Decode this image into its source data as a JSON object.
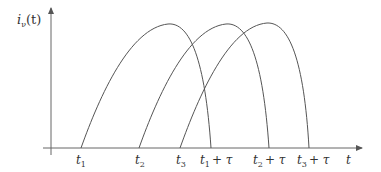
{
  "diagram": {
    "y_axis_label": {
      "base": "i",
      "sub": "ν",
      "arg": "(t)"
    },
    "x_axis_label": "t",
    "start_labels": [
      {
        "base": "t",
        "sub": "1",
        "x": 81
      },
      {
        "base": "t",
        "sub": "2",
        "x": 139
      },
      {
        "base": "t",
        "sub": "3",
        "x": 180
      }
    ],
    "end_labels": [
      {
        "base": "t",
        "sub": "1",
        "suffix": "+ τ",
        "x": 211
      },
      {
        "base": "t",
        "sub": "2",
        "suffix": "+ τ",
        "x": 269
      },
      {
        "base": "t",
        "sub": "3",
        "suffix": "+ τ",
        "x": 309
      }
    ],
    "stroke_color": "#555555"
  }
}
